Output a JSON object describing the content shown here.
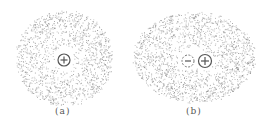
{
  "figure": {
    "panels": [
      {
        "id": "a",
        "label": "(a)",
        "description": "symmetric electron cloud around positive nucleus",
        "center": [
          64,
          58
        ],
        "radius_x": 48,
        "radius_y": 47,
        "charges": [
          {
            "sign": "+",
            "x": 64,
            "y": 60,
            "style": "solid"
          }
        ]
      },
      {
        "id": "b",
        "label": "(b)",
        "description": "polarized electron cloud: negative charge center shifted from nucleus",
        "center": [
          194,
          57
        ],
        "radius_x": 60,
        "radius_y": 45,
        "charges": [
          {
            "sign": "−",
            "x": 188,
            "y": 61,
            "style": "dashed"
          },
          {
            "sign": "+",
            "x": 205,
            "y": 61,
            "style": "solid"
          }
        ]
      }
    ],
    "colors": {
      "dots": "#8a8a8a",
      "charge_stroke": "#555555",
      "label": "#555555"
    }
  }
}
